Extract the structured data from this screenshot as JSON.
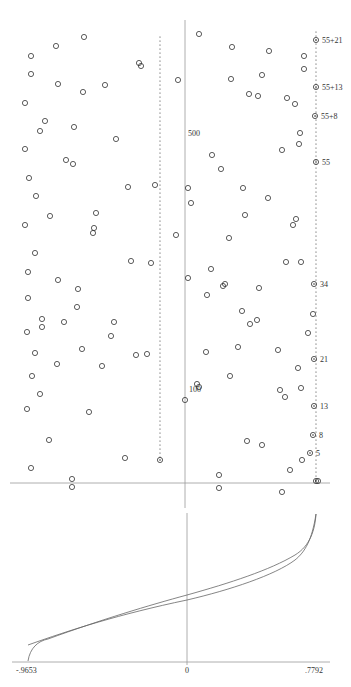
{
  "chart_data": [
    {
      "type": "scatter",
      "title": "",
      "xlabel": "",
      "ylabel": "",
      "grid": false,
      "axis_labels": {
        "y_tick_500": "500",
        "y_tick_100": "100"
      },
      "fib_labels": [
        {
          "label": "55+21",
          "x": 316,
          "y": 40
        },
        {
          "label": "55+13",
          "x": 316,
          "y": 87
        },
        {
          "label": "55+8",
          "x": 315,
          "y": 116
        },
        {
          "label": "55",
          "x": 316,
          "y": 162
        },
        {
          "label": "34",
          "x": 314,
          "y": 284
        },
        {
          "label": "21",
          "x": 314,
          "y": 359
        },
        {
          "label": "13",
          "x": 314,
          "y": 406
        },
        {
          "label": "8",
          "x": 313,
          "y": 435
        },
        {
          "label": "5",
          "x": 310,
          "y": 453
        }
      ],
      "dotted_columns": [
        {
          "x": 160,
          "y_start": 37,
          "y_end": 460,
          "end_marker": true
        },
        {
          "x": 316,
          "y_start": 32,
          "y_end": 481,
          "end_marker": true
        }
      ],
      "points": [
        [
          84,
          37
        ],
        [
          56,
          46
        ],
        [
          31,
          56
        ],
        [
          139,
          63
        ],
        [
          141,
          66
        ],
        [
          31,
          74
        ],
        [
          58,
          84
        ],
        [
          83,
          92
        ],
        [
          25,
          103
        ],
        [
          105,
          85
        ],
        [
          45,
          121
        ],
        [
          40,
          131
        ],
        [
          116,
          139
        ],
        [
          74,
          127
        ],
        [
          25,
          149
        ],
        [
          66,
          160
        ],
        [
          73,
          164
        ],
        [
          29,
          178
        ],
        [
          155,
          185
        ],
        [
          36,
          196
        ],
        [
          128,
          187
        ],
        [
          96,
          213
        ],
        [
          50,
          216
        ],
        [
          25,
          225
        ],
        [
          93,
          233
        ],
        [
          94,
          228
        ],
        [
          35,
          253
        ],
        [
          131,
          261
        ],
        [
          151,
          263
        ],
        [
          28,
          272
        ],
        [
          58,
          280
        ],
        [
          78,
          289
        ],
        [
          28,
          298
        ],
        [
          77,
          307
        ],
        [
          27,
          332
        ],
        [
          64,
          322
        ],
        [
          42,
          319
        ],
        [
          114,
          322
        ],
        [
          111,
          336
        ],
        [
          42,
          327
        ],
        [
          35,
          353
        ],
        [
          82,
          349
        ],
        [
          57,
          364
        ],
        [
          102,
          366
        ],
        [
          32,
          376
        ],
        [
          136,
          355
        ],
        [
          147,
          354
        ],
        [
          27,
          409
        ],
        [
          40,
          394
        ],
        [
          89,
          412
        ],
        [
          49,
          440
        ],
        [
          125,
          458
        ],
        [
          31,
          468
        ],
        [
          72,
          479
        ],
        [
          72,
          487
        ],
        [
          199,
          34
        ],
        [
          232,
          47
        ],
        [
          269,
          51
        ],
        [
          304,
          56
        ],
        [
          304,
          69
        ],
        [
          231,
          79
        ],
        [
          262,
          75
        ],
        [
          178,
          80
        ],
        [
          287,
          98
        ],
        [
          295,
          104
        ],
        [
          249,
          94
        ],
        [
          258,
          96
        ],
        [
          300,
          133
        ],
        [
          299,
          144
        ],
        [
          282,
          150
        ],
        [
          212,
          155
        ],
        [
          221,
          169
        ],
        [
          188,
          188
        ],
        [
          191,
          203
        ],
        [
          243,
          188
        ],
        [
          268,
          198
        ],
        [
          296,
          219
        ],
        [
          293,
          225
        ],
        [
          176,
          235
        ],
        [
          229,
          238
        ],
        [
          286,
          262
        ],
        [
          301,
          262
        ],
        [
          225,
          284
        ],
        [
          259,
          288
        ],
        [
          223,
          286
        ],
        [
          242,
          311
        ],
        [
          211,
          269
        ],
        [
          188,
          278
        ],
        [
          245,
          215
        ],
        [
          207,
          295
        ],
        [
          250,
          324
        ],
        [
          257,
          320
        ],
        [
          278,
          350
        ],
        [
          313,
          314
        ],
        [
          308,
          333
        ],
        [
          238,
          347
        ],
        [
          298,
          368
        ],
        [
          301,
          388
        ],
        [
          206,
          352
        ],
        [
          230,
          376
        ],
        [
          185,
          400
        ],
        [
          197,
          384
        ],
        [
          199,
          387
        ],
        [
          280,
          390
        ],
        [
          285,
          397
        ],
        [
          247,
          441
        ],
        [
          262,
          445
        ],
        [
          302,
          460
        ],
        [
          290,
          470
        ],
        [
          219,
          475
        ],
        [
          219,
          488
        ],
        [
          282,
          492
        ],
        [
          318,
          481
        ]
      ]
    },
    {
      "type": "line",
      "title": "",
      "xlabel": "",
      "ylabel": "",
      "x_tick_labels": [
        "-.9653",
        "0",
        ".7792"
      ],
      "xlim": [
        -0.9653,
        0.7792
      ],
      "grid": false,
      "series": [
        {
          "name": "curve-a",
          "description": "monotonic S-shaped curve from (-0.9653, bottom) rising to (0.7792, top)"
        },
        {
          "name": "curve-b",
          "description": "near-linear approximating curve crossing curve-a near x=-0.85 and merging near x=0.6"
        }
      ]
    }
  ],
  "labels": {
    "tick_500": "500",
    "tick_100": "100",
    "fib": [
      "55+21",
      "55+13",
      "55+8",
      "55",
      "34",
      "21",
      "13",
      "8",
      "5"
    ],
    "x_min": "-.9653",
    "x_zero": "0",
    "x_max": ".7792"
  },
  "colors": {
    "axis": "#888888",
    "point": "#333333",
    "curve": "#555555",
    "text": "#333333"
  }
}
